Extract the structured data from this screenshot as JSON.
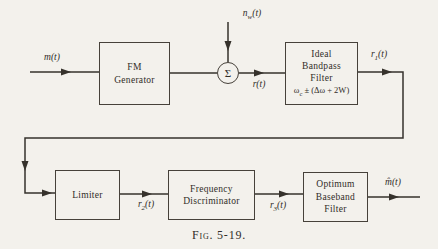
{
  "figure": {
    "caption": "Fig. 5-19.",
    "colors": {
      "background": "#f3f1ec",
      "ink": "#312d28",
      "line": "#36322c"
    }
  },
  "blocks": {
    "fm_generator": {
      "line1": "FM",
      "line2": "Generator"
    },
    "summer": {
      "symbol": "Σ"
    },
    "bandpass_filter": {
      "line1": "Ideal",
      "line2": "Bandpass",
      "line3": "Filter",
      "formula": {
        "base": "ω",
        "sub": "c",
        "rest": " ± (Δω + 2W)"
      }
    },
    "limiter": {
      "line1": "Limiter"
    },
    "discriminator": {
      "line1": "Frequency",
      "line2": "Discriminator"
    },
    "baseband_filter": {
      "line1": "Optimum",
      "line2": "Baseband",
      "line3": "Filter"
    }
  },
  "signals": {
    "message": {
      "text": "m(t)"
    },
    "noise": {
      "base": "n",
      "sub": "w",
      "arg": "(t)"
    },
    "received": {
      "text": "r(t)"
    },
    "r1": {
      "base": "r",
      "sub": "1",
      "arg": "(t)"
    },
    "r2": {
      "base": "r",
      "sub": "2",
      "arg": "(t)"
    },
    "r3": {
      "base": "r",
      "sub": "3",
      "arg": "(t)"
    },
    "output": {
      "text": "m̂(t)"
    }
  }
}
